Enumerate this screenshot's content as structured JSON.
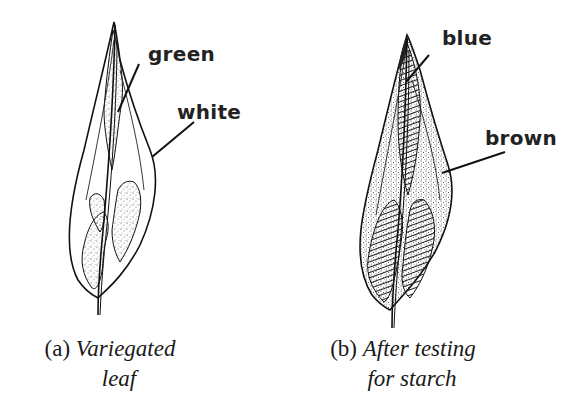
{
  "figure": {
    "panel_a": {
      "labels": {
        "green": "green",
        "white": "white"
      },
      "caption": {
        "marker": "(a)",
        "line1": "Variegated",
        "line2": "leaf"
      }
    },
    "panel_b": {
      "labels": {
        "blue": "blue",
        "brown": "brown"
      },
      "caption": {
        "marker": "(b)",
        "line1": "After testing",
        "line2": "for starch"
      }
    }
  }
}
